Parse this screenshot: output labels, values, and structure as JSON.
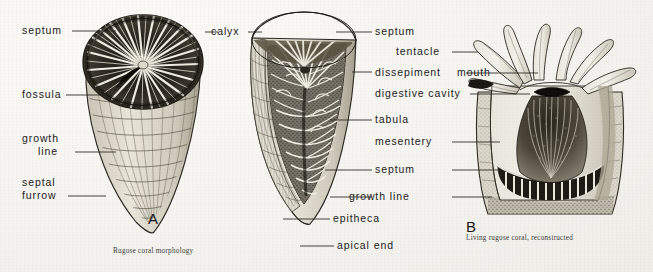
{
  "plate": {
    "title": "Rugose coral morphology plate",
    "background_color": "#f6f5f2",
    "ink_color": "#1b1b1b"
  },
  "figures": [
    {
      "letter": "A",
      "caption": "Rugose coral morphology",
      "description": "External view of solitary horn coral with calyx"
    },
    {
      "letter": "A2",
      "caption": "",
      "description": "Longitudinal section of solitary horn coral"
    },
    {
      "letter": "B",
      "caption": "Living rugose coral, reconstructed",
      "description": "Cutaway of living coral polyp in corallum"
    }
  ],
  "labels_left": [
    {
      "text": "septum",
      "lines": [
        "septum"
      ]
    },
    {
      "text": "fossula",
      "lines": [
        "fossula"
      ]
    },
    {
      "text": "growth line",
      "lines": [
        "growth",
        "line"
      ]
    },
    {
      "text": "septal furrow",
      "lines": [
        "septal",
        "furrow"
      ]
    }
  ],
  "labels_center": [
    {
      "text": "calyx"
    },
    {
      "text": "epitheca"
    },
    {
      "text": "apical end"
    }
  ],
  "labels_right": [
    {
      "text": "septum"
    },
    {
      "text": "tentacle"
    },
    {
      "text": "dissepiment"
    },
    {
      "text": "mouth"
    },
    {
      "text": "digestive cavity"
    },
    {
      "text": "tabula"
    },
    {
      "text": "mesentery"
    },
    {
      "text": "septum"
    },
    {
      "text": "growth line"
    }
  ],
  "figure_letters": {
    "a": "A",
    "b": "B"
  },
  "captions": {
    "a": "Rugose coral morphology",
    "b": "Living rugose coral, reconstructed"
  }
}
